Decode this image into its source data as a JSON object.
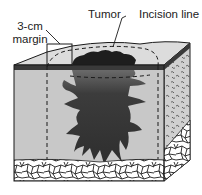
{
  "diagram": {
    "labels": {
      "margin_line1": "3-cm",
      "margin_line2": "margin",
      "tumor": "Tumor",
      "incision": "Incision line"
    },
    "colors": {
      "skin_top": "#dcdcdc",
      "epidermis_band": "#3a3a3a",
      "dermis": "#c8c8c8",
      "tumor_surface": "#1e1e1e",
      "tumor_deep": "#4a4a4a",
      "fat_lines": "#222222",
      "outline": "#1a1a1a"
    },
    "annotations": [
      {
        "name": "margin-box",
        "description": "3-cm margin"
      },
      {
        "name": "tumor-leader",
        "description": "Tumor"
      },
      {
        "name": "incision-line",
        "description": "Incision line (dashed)"
      }
    ]
  }
}
